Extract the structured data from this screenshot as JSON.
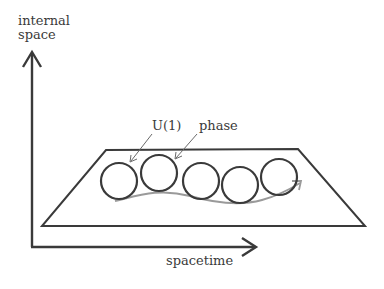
{
  "diagram": {
    "axes": {
      "y_label_line1": "internal",
      "y_label_line2": "space",
      "x_label": "spacetime"
    },
    "annotations": {
      "u1": "U(1)",
      "phase": "phase"
    },
    "circles": [
      {
        "cx": 119,
        "cy": 181,
        "r": 18
      },
      {
        "cx": 159,
        "cy": 173,
        "r": 18
      },
      {
        "cx": 201,
        "cy": 181,
        "r": 18
      },
      {
        "cx": 240,
        "cy": 185,
        "r": 18
      },
      {
        "cx": 279,
        "cy": 177,
        "r": 18
      }
    ],
    "colors": {
      "ink": "#3a3a3a",
      "curve": "#9a9a9a",
      "pointer": "#6a6a6a"
    }
  }
}
